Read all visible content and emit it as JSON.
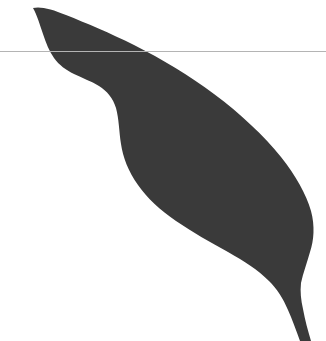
{
  "image": {
    "title": "Leaf silhouette",
    "width": 326,
    "height": 341,
    "background_color": "#ffffff"
  },
  "figure": {
    "subject_name": "leaf-silhouette",
    "subject_description": "Solid dark charcoal silhouette of a long lanceolate leaf, tip at upper-left, blade sweeping down to a narrow stem exiting the lower-right corner",
    "fill_color": "#3a3a3a",
    "orientation": "tip-upper-left-stem-lower-right"
  },
  "rule": {
    "name": "horizontal-rule",
    "color": "#b4b4b4",
    "y": 51,
    "x_start": 0,
    "x_end": 326,
    "thickness": 1
  },
  "geometry": {
    "leaf_outline_path": "M 33 8 C 40 6 52 9 66 15 C 86 23 110 33 134 45 C 162 59 190 76 214 94 C 241 114 264 136 281 157 C 296 176 306 194 311 211 C 315 226 314 240 310 252 C 307 263 303 273 301 283 C 300 292 301 300 303 309 C 305 320 308 331 311 341 L 300 341 C 296 330 292 319 288 310 C 283 298 277 289 269 281 C 258 270 244 261 228 252 C 210 242 192 232 176 221 C 160 210 147 198 138 185 C 128 171 123 157 121 144 C 119 131 119 119 116 108 C 113 98 107 91 99 86 C 91 81 82 78 74 74 C 66 70 59 65 54 58 C 49 51 46 43 43 34 C 40 25 37 15 33 8 Z",
    "tip_point": [
      33,
      8
    ],
    "widest_right_x": 315,
    "stem_exit_x": 306
  }
}
